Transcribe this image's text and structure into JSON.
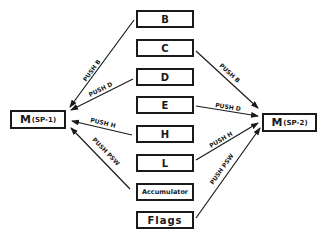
{
  "registers": [
    {
      "label": "B",
      "top": 10
    },
    {
      "label": "C",
      "top": 39
    },
    {
      "label": "D",
      "top": 68
    },
    {
      "label": "E",
      "top": 96
    },
    {
      "label": "H",
      "top": 125
    },
    {
      "label": "L",
      "top": 154
    },
    {
      "label": "Accumulator",
      "top": 183
    },
    {
      "label": "Flags",
      "top": 211
    }
  ],
  "memory_left": {
    "main": "M",
    "sub": "(SP-1)"
  },
  "memory_right": {
    "main": "M",
    "sub": "(SP-2)"
  },
  "arrows_left": [
    {
      "label": "PUSH B",
      "from": "B",
      "to": "M(SP-1)"
    },
    {
      "label": "PUSH D",
      "from": "D",
      "to": "M(SP-1)"
    },
    {
      "label": "PUSH H",
      "from": "H",
      "to": "M(SP-1)"
    },
    {
      "label": "PUSH PSW",
      "from": "Accumulator",
      "to": "M(SP-1)"
    }
  ],
  "arrows_right": [
    {
      "label": "PUSH B",
      "from": "C",
      "to": "M(SP-2)"
    },
    {
      "label": "PUSH D",
      "from": "E",
      "to": "M(SP-2)"
    },
    {
      "label": "PUSH H",
      "from": "L",
      "to": "M(SP-2)"
    },
    {
      "label": "PUSH PSW",
      "from": "Flags",
      "to": "M(SP-2)"
    }
  ]
}
